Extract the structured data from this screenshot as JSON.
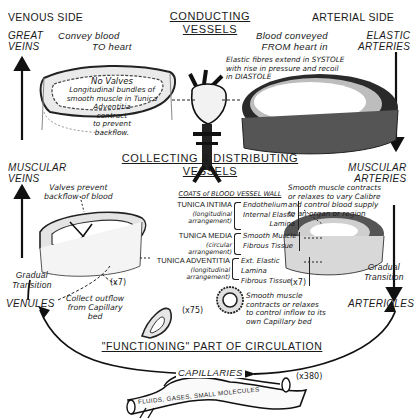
{
  "side_labels": {
    "venous": "VENOUS SIDE",
    "arterial": "ARTERIAL SIDE"
  },
  "sections": {
    "conducting": [
      "CONDUCTING",
      "VESSELS"
    ],
    "collecting_distributing": [
      "COLLECTING & DISTRIBUTING",
      "VESSELS"
    ],
    "functioning": "\"FUNCTIONING\" PART OF CIRCULATION"
  },
  "venous": {
    "great_veins": {
      "label": [
        "GREAT",
        "VEINS"
      ],
      "note": [
        "Convey blood",
        "TO heart"
      ]
    },
    "great_vein_section": {
      "note": [
        "No Valves",
        "Longitudinal bundles of",
        "smooth muscle in Tunica",
        "Adventitia",
        "contract",
        "to prevent",
        "backflow."
      ]
    },
    "muscular_veins": {
      "label": [
        "MUSCULAR",
        "VEINS"
      ],
      "note": [
        "Valves prevent",
        "backflow of blood"
      ],
      "magnification": "(x7)"
    },
    "transition": [
      "Gradual",
      "Transition"
    ],
    "venules": {
      "label": "VENULES",
      "note": [
        "Collect outflow",
        "from Capillary",
        "bed"
      ],
      "magnification": "(x75)"
    }
  },
  "arterial": {
    "elastic_arteries": {
      "label": [
        "ELASTIC",
        "ARTERIES"
      ],
      "note": [
        "Blood conveyed",
        "FROM heart in"
      ],
      "section_note": [
        "Elastic fibres extend in SYSTOLE",
        "with rise in pressure and recoil",
        "in DIASTOLE"
      ]
    },
    "muscular_arteries": {
      "label": [
        "MUSCULAR",
        "ARTERIES"
      ],
      "note": [
        "Smooth muscle contracts",
        "or relaxes to vary Calibre",
        "and control blood supply",
        "to an organ or region"
      ],
      "magnification": "(x7)"
    },
    "transition": [
      "Gradual",
      "Transition"
    ],
    "arterioles": {
      "label": "ARTERIOLES",
      "note": [
        "Smooth muscle",
        "contracts or relaxes",
        "to control inflow to its",
        "own Capillary bed"
      ]
    }
  },
  "coats": {
    "title": "COATS of BLOOD VESSEL WALL",
    "rows": [
      {
        "name": "TUNICA INTIMA",
        "arrangement": [
          "(longitudinal",
          "arrangement)"
        ],
        "layers": [
          "Endothelium",
          "Internal Elastic",
          "Lamina"
        ]
      },
      {
        "name": "TUNICA MEDIA",
        "arrangement": [
          "(circular",
          "arrangement)"
        ],
        "layers": [
          "Smooth Muscle",
          "Fibrous Tissue"
        ]
      },
      {
        "name": "TUNICA ADVENTITIA",
        "arrangement": [
          "(longitudinal",
          "arrangement)"
        ],
        "layers": [
          "Ext. Elastic Lamina",
          "Fibrous Tissue"
        ]
      }
    ]
  },
  "capillaries": {
    "label": "CAPILLARIES",
    "magnification": "(x380)",
    "contents": "FLUIDS, GASES, SMALL MOLECULES"
  }
}
